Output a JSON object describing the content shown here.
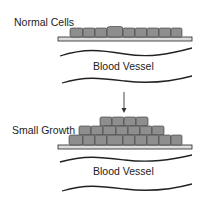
{
  "panels": [
    {
      "label": "Normal Cells",
      "vessel_label": "Blood Vessel"
    },
    {
      "label": "Small Growth",
      "vessel_label": "Blood Vessel"
    }
  ],
  "colors": {
    "cell_fill": "#8e8e8e",
    "cell_stroke": "#333333",
    "line": "#222222"
  }
}
